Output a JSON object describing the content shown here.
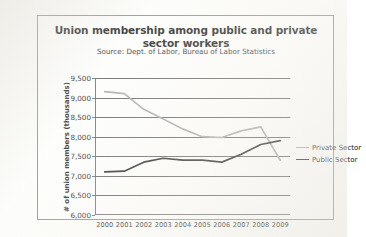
{
  "figure": {
    "title": "Union membership among public and private sector workers",
    "subtitle": "Source: Dept. of Labor, Bureau of Labor Statistics"
  },
  "legend": {
    "position": "right",
    "entries": [
      {
        "label": "Private Sector",
        "color": "#a8a8a8"
      },
      {
        "label": "Public Sector",
        "color": "#1f1f1f"
      }
    ]
  },
  "chart_data": {
    "type": "line",
    "title": "Union membership among public and private sector workers",
    "subtitle": "Source: Dept. of Labor, Bureau of Labor Statistics",
    "xlabel": "",
    "ylabel": "# of union members (thousands)",
    "x": [
      2000,
      2001,
      2002,
      2003,
      2004,
      2005,
      2006,
      2007,
      2008,
      2009
    ],
    "categories": [
      "2000",
      "2001",
      "2002",
      "2003",
      "2004",
      "2005",
      "2006",
      "2007",
      "2008",
      "2009"
    ],
    "ylim": [
      6000,
      9500
    ],
    "yticks": [
      6000,
      6500,
      7000,
      7500,
      8000,
      8500,
      9000,
      9500
    ],
    "ytick_labels": [
      "6,000",
      "6,500",
      "7,000",
      "7,500",
      "8,000",
      "8,500",
      "9,000",
      "9,500"
    ],
    "grid": true,
    "grid_axis": "y",
    "legend_position": "right",
    "series": [
      {
        "name": "Private Sector",
        "color": "#a8a8a8",
        "values": [
          9150,
          9100,
          8700,
          8450,
          8200,
          8000,
          7980,
          8150,
          8250,
          7400
        ]
      },
      {
        "name": "Public Sector",
        "color": "#1f1f1f",
        "values": [
          7100,
          7120,
          7350,
          7450,
          7400,
          7400,
          7350,
          7550,
          7800,
          7900
        ]
      }
    ]
  }
}
